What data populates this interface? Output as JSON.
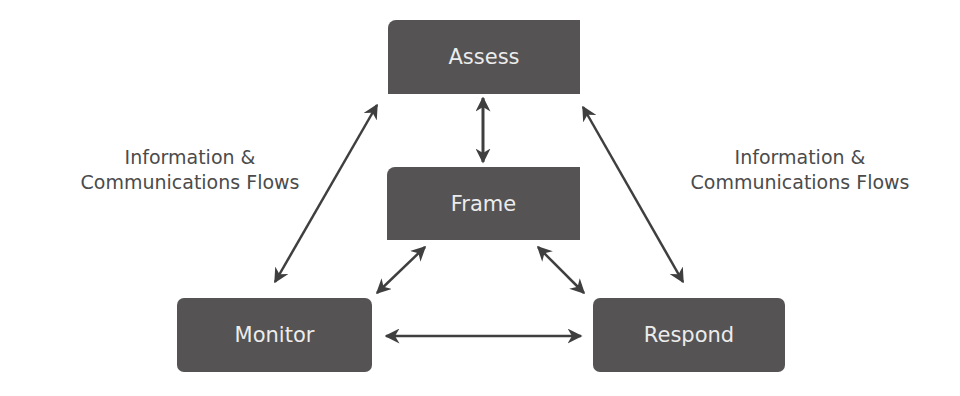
{
  "diagram": {
    "nodes": {
      "assess": "Assess",
      "frame": "Frame",
      "monitor": "Monitor",
      "respond": "Respond"
    },
    "labels": {
      "left": {
        "line1": "Information &",
        "line2": "Communications Flows"
      },
      "right": {
        "line1": "Information &",
        "line2": "Communications Flows"
      }
    },
    "edges": [
      {
        "from": "Assess",
        "to": "Frame",
        "type": "bidirectional"
      },
      {
        "from": "Assess",
        "to": "Monitor",
        "type": "bidirectional"
      },
      {
        "from": "Assess",
        "to": "Respond",
        "type": "bidirectional"
      },
      {
        "from": "Frame",
        "to": "Monitor",
        "type": "bidirectional"
      },
      {
        "from": "Frame",
        "to": "Respond",
        "type": "bidirectional"
      },
      {
        "from": "Monitor",
        "to": "Respond",
        "type": "bidirectional"
      }
    ],
    "colors": {
      "node_fill": "#555354",
      "node_text": "#ececec",
      "arrow": "#3f3f3f",
      "label_text": "#4b4b4b"
    }
  }
}
